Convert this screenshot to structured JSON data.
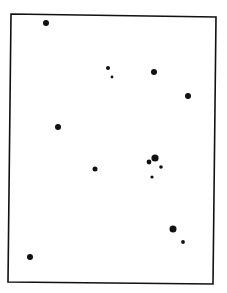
{
  "figure": {
    "background": "#ffffff",
    "ink": "#111111",
    "frame": {
      "corners": [
        [
          11,
          14
        ],
        [
          216,
          17
        ],
        [
          213,
          284
        ],
        [
          8,
          282
        ]
      ],
      "stroke_width": 1.6
    },
    "dots": [
      {
        "x": 46,
        "y": 23,
        "r": 3.0
      },
      {
        "x": 108,
        "y": 68,
        "r": 2.0
      },
      {
        "x": 112,
        "y": 77,
        "r": 1.4
      },
      {
        "x": 154,
        "y": 72,
        "r": 3.0
      },
      {
        "x": 188,
        "y": 96,
        "r": 3.0
      },
      {
        "x": 58,
        "y": 127,
        "r": 3.0
      },
      {
        "x": 95,
        "y": 169,
        "r": 2.5
      },
      {
        "x": 155,
        "y": 158,
        "r": 3.6
      },
      {
        "x": 149,
        "y": 162,
        "r": 2.4
      },
      {
        "x": 161,
        "y": 167,
        "r": 1.8
      },
      {
        "x": 152,
        "y": 177,
        "r": 1.6
      },
      {
        "x": 173,
        "y": 229,
        "r": 3.5
      },
      {
        "x": 183,
        "y": 242,
        "r": 1.9
      },
      {
        "x": 30,
        "y": 257,
        "r": 3.0
      }
    ]
  }
}
